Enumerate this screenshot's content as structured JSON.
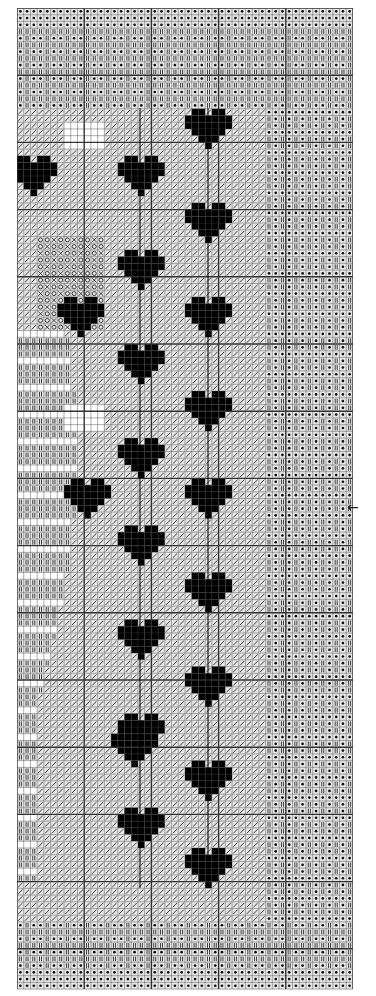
{
  "chart_data": {
    "type": "table",
    "title": "",
    "grid": {
      "cols": 50,
      "rows": 146,
      "cell_px": 6.7,
      "bold_every": 10
    },
    "symbols": {
      "dot": "filled dot in square (border bands, right column)",
      "bar": "double vertical bar stitch (border bands)",
      "slash": "diagonal slash (main background)",
      "x": "cross stitch symbol",
      "o": "open circle symbol",
      "solid": "solid black fill (hearts)",
      "blank": "unstitched"
    },
    "hearts_left_column_center_y": [
      178,
      270,
      362,
      455,
      548,
      640,
      733,
      826
    ],
    "hearts_right_column_center_y": [
      130,
      225,
      316,
      408,
      500,
      592,
      685,
      778,
      870
    ],
    "center_marker": {
      "symbol": "←",
      "y": 508
    }
  },
  "marker": {
    "arrow": "←"
  }
}
